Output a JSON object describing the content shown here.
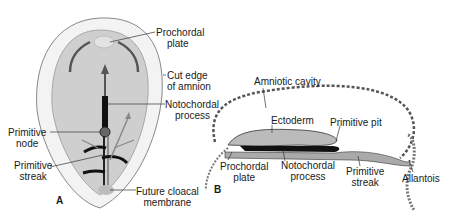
{
  "figure": {
    "panels": [
      {
        "letter": "A",
        "view": "dorsal view of embryonic disc",
        "labels": {
          "prochordal_plate_1": "Prochordal",
          "prochordal_plate_2": "plate",
          "cut_edge_1": "Cut edge",
          "cut_edge_2": "of amnion",
          "notochordal_process_1": "Notochordal",
          "notochordal_process_2": "process",
          "primitive_node_1": "Primitive",
          "primitive_node_2": "node",
          "primitive_streak_1": "Primitive",
          "primitive_streak_2": "streak",
          "cloacal_1": "Future cloacal",
          "cloacal_2": "membrane"
        }
      },
      {
        "letter": "B",
        "view": "sagittal section",
        "labels": {
          "amniotic_cavity": "Amniotic cavity",
          "ectoderm": "Ectoderm",
          "primitive_pit": "Primitive pit",
          "prochordal_plate_1": "Prochordal",
          "prochordal_plate_2": "plate",
          "notochordal_process_1": "Notochordal",
          "notochordal_process_2": "process",
          "primitive_streak_1": "Primitive",
          "primitive_streak_2": "streak",
          "allantois": "Allantois"
        }
      }
    ],
    "colors": {
      "disc_fill": "#cfcfcf",
      "amnion_fill": "#f2f2f2",
      "line": "#333333",
      "notochord": "#111111"
    }
  }
}
